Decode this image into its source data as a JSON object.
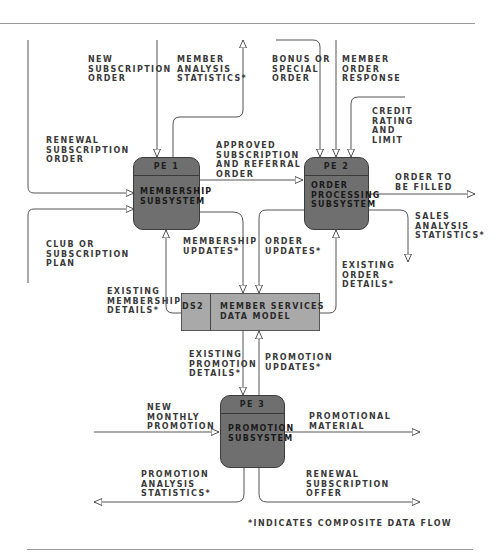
{
  "processes": [
    {
      "id": "PE 1",
      "name": "MEMBERSHIP\nSUBSYSTEM"
    },
    {
      "id": "PE 2",
      "name": "ORDER\nPROCESSING\nSUBSYSTEM"
    },
    {
      "id": "PE 3",
      "name": "PROMOTION\nSUBSYSTEM"
    }
  ],
  "data_store": {
    "id": "DS2",
    "name": "MEMBER SERVICES\nDATA MODEL"
  },
  "flows": {
    "new_subscription_order": "NEW\nSUBSCRIPTION\nORDER",
    "member_analysis_statistics": "MEMBER\nANALYSIS\nSTATISTICS*",
    "bonus_or_special_order": "BONUS OR\nSPECIAL\nORDER",
    "member_order_response": "MEMBER\nORDER\nRESPONSE",
    "credit_rating_and_limit": "CREDIT\nRATING\nAND\nLIMIT",
    "renewal_subscription_order": "RENEWAL\nSUBSCRIPTION\nORDER",
    "approved_subscription": "APPROVED\nSUBSCRIPTION\nAND REFERRAL\nORDER",
    "order_to_be_filled": "ORDER TO\nBE FILLED",
    "sales_analysis_statistics": "SALES\nANALYSIS\nSTATISTICS*",
    "club_or_subscription_plan": "CLUB OR\nSUBSCRIPTION\nPLAN",
    "membership_updates": "MEMBERSHIP\nUPDATES*",
    "order_updates": "ORDER\nUPDATES*",
    "existing_order_details": "EXISTING\nORDER\nDETAILS*",
    "existing_membership_details": "EXISTING\nMEMBERSHIP\nDETAILS*",
    "existing_promotion_details": "EXISTING\nPROMOTION\nDETAILS*",
    "promotion_updates": "PROMOTION\nUPDATES*",
    "new_monthly_promotion": "NEW\nMONTHLY\nPROMOTION",
    "promotional_material": "PROMOTIONAL\nMATERIAL",
    "promotion_analysis_statistics": "PROMOTION\nANALYSIS\nSTATISTICS*",
    "renewal_subscription_offer": "RENEWAL\nSUBSCRIPTION\nOFFER"
  },
  "footnote": "*INDICATES COMPOSITE DATA FLOW",
  "colors": {
    "process_fill": "#6f6f6f",
    "store_fill": "#a9a9a9",
    "line": "#555555",
    "rule": "#9a9a9a"
  }
}
